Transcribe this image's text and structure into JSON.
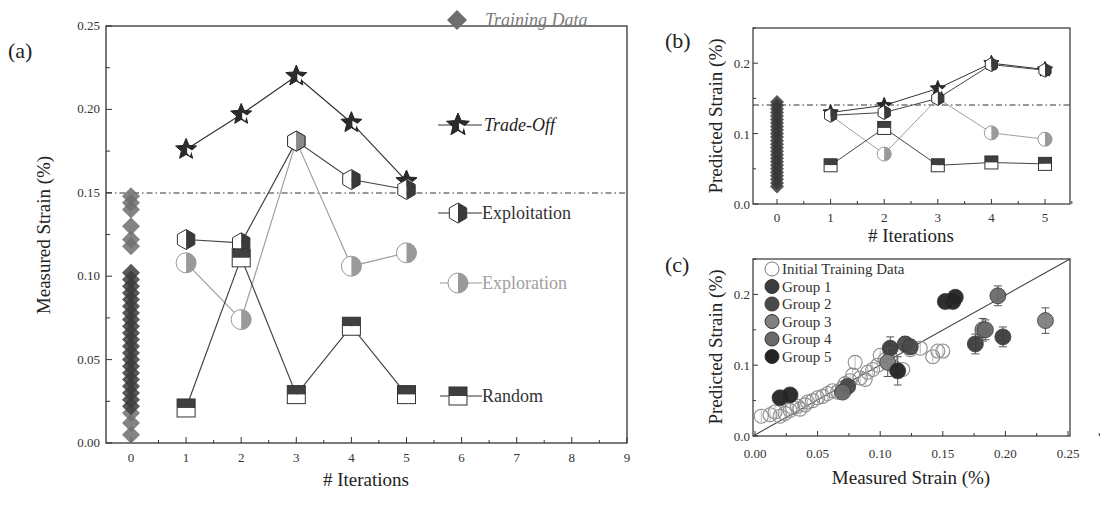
{
  "figure": {
    "panels": [
      "(a)",
      "(b)",
      "(c)"
    ]
  },
  "colors": {
    "tradeoff": "#2b2b2b",
    "exploitation": "#3a3a3a",
    "exploration": "#9a9a9a",
    "random": "#3f3f3f",
    "training": "#6e6e6e",
    "group1": "#3c3c3c",
    "group2": "#4a4a4a",
    "group3": "#808080",
    "group4": "#6a6a6a",
    "group5": "#242424"
  },
  "chart_data": [
    {
      "panel": "(a)",
      "type": "line",
      "title": "",
      "xlabel": "# Iterations",
      "ylabel": "Measured Strain (%)",
      "xlim": [
        -0.5,
        9
      ],
      "ylim": [
        0.0,
        0.25
      ],
      "xticks": [
        "0",
        "1",
        "2",
        "3",
        "4",
        "5",
        "6",
        "7",
        "8",
        "9"
      ],
      "yticks": [
        "0.00",
        "0.05",
        "0.10",
        "0.15",
        "0.20",
        "0.25"
      ],
      "threshold_line": 0.15,
      "grid": false,
      "legend_position": "right-inside",
      "x": [
        1,
        2,
        3,
        4,
        5
      ],
      "series": [
        {
          "name": "Trade-Off",
          "marker": "star",
          "values": [
            0.176,
            0.197,
            0.22,
            0.192,
            0.157
          ]
        },
        {
          "name": "Exploitation",
          "marker": "half-hexagon",
          "values": [
            0.122,
            0.12,
            0.181,
            0.158,
            0.152
          ]
        },
        {
          "name": "Exploration",
          "marker": "half-circle",
          "values": [
            0.108,
            0.074,
            0.181,
            0.106,
            0.114
          ]
        },
        {
          "name": "Random",
          "marker": "half-square",
          "values": [
            0.021,
            0.111,
            0.029,
            0.07,
            0.029
          ]
        }
      ],
      "training_data": {
        "name": "Training Data",
        "marker": "diamond",
        "x": 0,
        "range": [
          0.005,
          0.148
        ],
        "values": [
          0.005,
          0.012,
          0.018,
          0.022,
          0.026,
          0.03,
          0.034,
          0.038,
          0.042,
          0.046,
          0.05,
          0.054,
          0.058,
          0.062,
          0.066,
          0.07,
          0.074,
          0.078,
          0.082,
          0.086,
          0.09,
          0.094,
          0.098,
          0.102,
          0.118,
          0.122,
          0.13,
          0.14,
          0.144,
          0.148
        ]
      },
      "legend": [
        "Training Data",
        "Trade-Off",
        "Exploitation",
        "Exploration",
        "Random"
      ]
    },
    {
      "panel": "(b)",
      "type": "line",
      "title": "",
      "xlabel": "# Iterations",
      "ylabel": "Predicted Strain (%)",
      "xlim": [
        -0.5,
        5.5
      ],
      "ylim": [
        0.0,
        0.25
      ],
      "xticks": [
        "0",
        "1",
        "2",
        "3",
        "4",
        "5"
      ],
      "yticks": [
        "0.0",
        "0.1",
        "0.2"
      ],
      "threshold_line": 0.142,
      "grid": false,
      "x": [
        1,
        2,
        3,
        4,
        5
      ],
      "series": [
        {
          "name": "Trade-Off",
          "marker": "star",
          "values": [
            0.13,
            0.14,
            0.164,
            0.2,
            0.191
          ]
        },
        {
          "name": "Exploitation",
          "marker": "half-hexagon",
          "values": [
            0.126,
            0.13,
            0.15,
            0.198,
            0.19
          ]
        },
        {
          "name": "Exploration",
          "marker": "half-circle",
          "values": [
            0.126,
            0.071,
            0.15,
            0.101,
            0.092
          ]
        },
        {
          "name": "Random",
          "marker": "half-square",
          "values": [
            0.055,
            0.108,
            0.055,
            0.059,
            0.057
          ]
        }
      ],
      "training_data": {
        "name": "Training Data",
        "marker": "diamond",
        "x": 0,
        "range": [
          0.025,
          0.145
        ],
        "values": [
          0.025,
          0.03,
          0.035,
          0.04,
          0.045,
          0.05,
          0.055,
          0.06,
          0.065,
          0.07,
          0.075,
          0.08,
          0.085,
          0.09,
          0.095,
          0.1,
          0.105,
          0.11,
          0.115,
          0.12,
          0.125,
          0.13,
          0.135,
          0.14,
          0.145
        ]
      }
    },
    {
      "panel": "(c)",
      "type": "scatter",
      "title": "",
      "xlabel": "Measured Strain (%)",
      "ylabel": "Predicted Strain (%)",
      "xlim": [
        0.0,
        0.25
      ],
      "ylim": [
        0.0,
        0.25
      ],
      "xticks": [
        "0.00",
        "0.05",
        "0.10",
        "0.15",
        "0.20",
        "0.25"
      ],
      "yticks": [
        "0.0",
        "0.1",
        "0.2"
      ],
      "diagonal_line": true,
      "grid": false,
      "legend_position": "upper-left",
      "legend": [
        "Initial Training Data",
        "Group 1",
        "Group 2",
        "Group 3",
        "Group 4",
        "Group 5"
      ],
      "series": [
        {
          "name": "Initial Training Data",
          "marker": "open-circle",
          "points": [
            [
              0.005,
              0.028
            ],
            [
              0.012,
              0.03
            ],
            [
              0.016,
              0.034
            ],
            [
              0.02,
              0.028
            ],
            [
              0.024,
              0.032
            ],
            [
              0.028,
              0.036
            ],
            [
              0.03,
              0.04
            ],
            [
              0.034,
              0.042
            ],
            [
              0.036,
              0.038
            ],
            [
              0.04,
              0.044
            ],
            [
              0.042,
              0.048
            ],
            [
              0.046,
              0.05
            ],
            [
              0.05,
              0.054
            ],
            [
              0.054,
              0.056
            ],
            [
              0.058,
              0.06
            ],
            [
              0.062,
              0.064
            ],
            [
              0.066,
              0.062
            ],
            [
              0.07,
              0.068
            ],
            [
              0.072,
              0.074
            ],
            [
              0.076,
              0.078
            ],
            [
              0.078,
              0.086
            ],
            [
              0.08,
              0.104
            ],
            [
              0.084,
              0.082
            ],
            [
              0.088,
              0.08
            ],
            [
              0.09,
              0.09
            ],
            [
              0.094,
              0.094
            ],
            [
              0.098,
              0.1
            ],
            [
              0.1,
              0.114
            ],
            [
              0.104,
              0.108
            ],
            [
              0.108,
              0.112
            ],
            [
              0.112,
              0.096
            ],
            [
              0.118,
              0.094
            ],
            [
              0.124,
              0.122
            ],
            [
              0.132,
              0.124
            ],
            [
              0.142,
              0.112
            ],
            [
              0.146,
              0.12
            ],
            [
              0.15,
              0.12
            ]
          ]
        },
        {
          "name": "Group 1",
          "marker": "filled-circle",
          "points": [
            [
              0.108,
              0.124
            ],
            [
              0.176,
              0.13
            ],
            [
              0.198,
              0.14
            ]
          ],
          "error": [
            0.016,
            0.014,
            0.014
          ]
        },
        {
          "name": "Group 2",
          "marker": "filled-circle",
          "points": [
            [
              0.12,
              0.13
            ],
            [
              0.124,
              0.126
            ],
            [
              0.074,
              0.07
            ]
          ],
          "error": [
            0.01,
            0.01,
            0.006
          ]
        },
        {
          "name": "Group 3",
          "marker": "filled-circle",
          "points": [
            [
              0.182,
              0.15
            ],
            [
              0.232,
              0.163
            ],
            [
              0.106,
              0.104
            ]
          ],
          "error": [
            0.016,
            0.018,
            0.02
          ]
        },
        {
          "name": "Group 4",
          "marker": "filled-circle",
          "points": [
            [
              0.194,
              0.198
            ],
            [
              0.184,
              0.15
            ],
            [
              0.07,
              0.062
            ]
          ],
          "error": [
            0.014,
            0.014,
            0.006
          ]
        },
        {
          "name": "Group 5",
          "marker": "filled-circle",
          "points": [
            [
              0.02,
              0.054
            ],
            [
              0.028,
              0.058
            ],
            [
              0.152,
              0.19
            ],
            [
              0.158,
              0.19
            ],
            [
              0.16,
              0.196
            ],
            [
              0.114,
              0.092
            ]
          ],
          "error": [
            0,
            0,
            0,
            0,
            0,
            0.02
          ]
        }
      ]
    }
  ],
  "labels": {
    "a_panel": "(a)",
    "b_panel": "(b)",
    "c_panel": "(c)",
    "a_xlabel": "# Iterations",
    "a_ylabel": "Measured Strain (%)",
    "b_xlabel": "# Iterations",
    "b_ylabel": "Predicted Strain (%)",
    "c_xlabel": "Measured Strain (%)",
    "c_ylabel": "Predicted Strain (%)",
    "legend_training": "Training Data",
    "legend_tradeoff": "Trade-Off",
    "legend_exploitation": "Exploitation",
    "legend_exploration": "Exploration",
    "legend_random": "Random",
    "legend_c": [
      "Initial Training Data",
      "Group 1",
      "Group 2",
      "Group 3",
      "Group 4",
      "Group 5"
    ]
  }
}
